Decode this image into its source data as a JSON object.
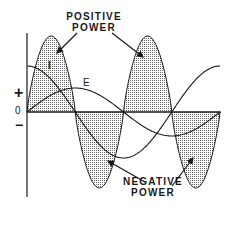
{
  "diagram": {
    "labels": {
      "positive_power_line1": "POSITIVE",
      "positive_power_line2": "POWER",
      "negative_power_line1": "NEGATIVE",
      "negative_power_line2": "POWER",
      "current": "I",
      "voltage": "E",
      "plus": "+",
      "zero": "0",
      "minus": "−"
    },
    "colors": {
      "line": "#1a1a1a",
      "stipple": "#555555",
      "background": "#ffffff"
    },
    "curves": {
      "current": {
        "name": "I",
        "shape": "cosine",
        "relative_amplitude": 1.0,
        "phase": "leads voltage by 90°"
      },
      "voltage": {
        "name": "E",
        "shape": "sine",
        "relative_amplitude": 0.5
      },
      "power": {
        "name": "P = E × I",
        "lobes": [
          "positive",
          "negative",
          "positive",
          "negative"
        ]
      }
    }
  }
}
